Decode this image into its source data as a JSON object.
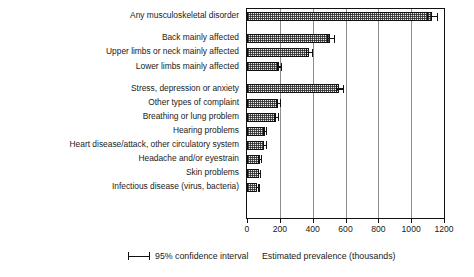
{
  "chart_data": {
    "type": "bar",
    "orientation": "horizontal",
    "title": "",
    "xlabel": "Estimated prevalence (thousands)",
    "ylabel": "",
    "xlim": [
      0,
      1200
    ],
    "xticks": [
      0,
      200,
      400,
      600,
      800,
      1000,
      1200
    ],
    "xticklabels": [
      "0",
      "200",
      "400",
      "600",
      "800",
      "1000",
      "1200"
    ],
    "grid": "vertical",
    "legend": {
      "position": "below-left",
      "entries": [
        {
          "label": "95% confidence interval",
          "symbol": "error-bar"
        }
      ]
    },
    "categories": [
      "Any musculoskeletal disorder",
      "Back mainly affected",
      "Upper limbs or neck mainly affected",
      "Lower limbs mainly affected",
      "Stress, depression or anxiety",
      "Other types of complaint",
      "Breathing or lung problem",
      "Hearing problems",
      "Heart disease/attack, other circulatory system",
      "Headache and/or eyestrain",
      "Skin problems",
      "Infectious disease (virus, bacteria)"
    ],
    "values": [
      1126,
      508,
      375,
      195,
      563,
      186,
      175,
      107,
      104,
      77,
      72,
      63
    ],
    "errors_low": [
      1094,
      486,
      357,
      183,
      540,
      174,
      163,
      98,
      95,
      69,
      64,
      56
    ],
    "errors_high": [
      1158,
      530,
      393,
      207,
      586,
      198,
      187,
      116,
      113,
      85,
      80,
      70
    ],
    "group_breaks_after": [
      0,
      3
    ],
    "bars": [
      {
        "label": "Any musculoskeletal disorder",
        "value": 1126,
        "low": 1094,
        "high": 1158,
        "group": 1
      },
      {
        "label": "Back mainly affected",
        "value": 508,
        "low": 486,
        "high": 530,
        "group": 2
      },
      {
        "label": "Upper limbs or neck mainly affected",
        "value": 375,
        "low": 357,
        "high": 393,
        "group": 2
      },
      {
        "label": "Lower limbs mainly affected",
        "value": 195,
        "low": 183,
        "high": 207,
        "group": 2
      },
      {
        "label": "Stress, depression or anxiety",
        "value": 563,
        "low": 540,
        "high": 586,
        "group": 3
      },
      {
        "label": "Other types of complaint",
        "value": 186,
        "low": 174,
        "high": 198,
        "group": 3
      },
      {
        "label": "Breathing or lung problem",
        "value": 175,
        "low": 163,
        "high": 187,
        "group": 3
      },
      {
        "label": "Hearing problems",
        "value": 107,
        "low": 98,
        "high": 116,
        "group": 3
      },
      {
        "label": "Heart disease/attack, other circulatory system",
        "value": 104,
        "low": 95,
        "high": 113,
        "group": 3
      },
      {
        "label": "Headache and/or eyestrain",
        "value": 77,
        "low": 69,
        "high": 85,
        "group": 3
      },
      {
        "label": "Skin problems",
        "value": 72,
        "low": 64,
        "high": 80,
        "group": 3
      },
      {
        "label": "Infectious disease (virus, bacteria)",
        "value": 63,
        "low": 56,
        "high": 70,
        "group": 3
      }
    ],
    "colors": {
      "bar_fill": "#e9e9e9",
      "bar_edge": "#111111",
      "grid": "#8d8d8d",
      "axis": "#111111",
      "text": "#1a1a1a",
      "background": "#ffffff"
    }
  }
}
